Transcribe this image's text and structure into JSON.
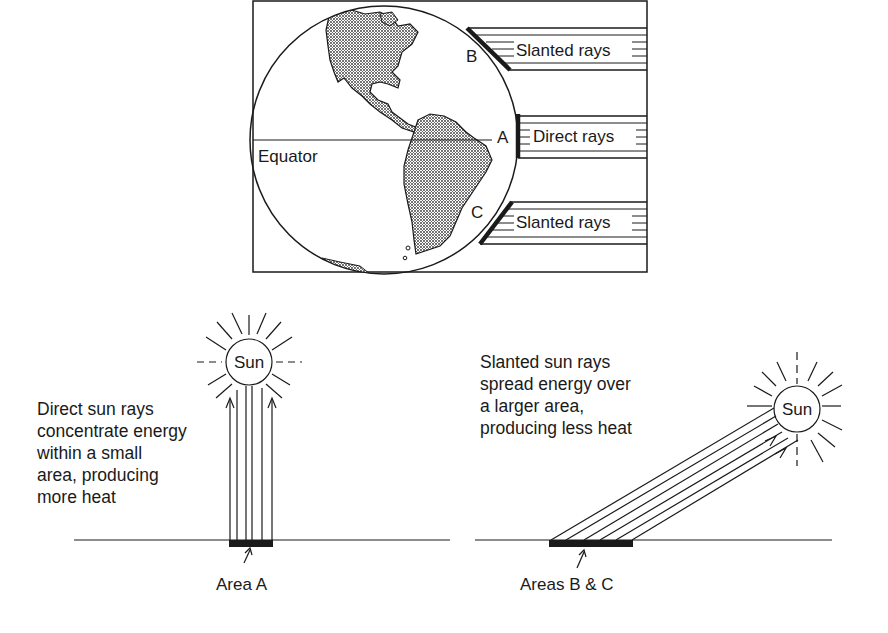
{
  "globe_panel": {
    "equator_label": "Equator",
    "points": [
      {
        "id": "B",
        "label": "B",
        "ray_label": "Slanted rays"
      },
      {
        "id": "A",
        "label": "A",
        "ray_label": "Direct rays"
      },
      {
        "id": "C",
        "label": "C",
        "ray_label": "Slanted rays"
      }
    ]
  },
  "direct_panel": {
    "sun_label": "Sun",
    "description": "Direct sun rays\nconcentrate energy\nwithin a small\narea, producing\nmore heat",
    "area_label": "Area A"
  },
  "slanted_panel": {
    "sun_label": "Sun",
    "description": "Slanted sun rays\nspread energy over\na larger area,\nproducing less heat",
    "area_label": "Areas B & C"
  },
  "colors": {
    "ink": "#1a1a1a",
    "land_fill": "#bdbdbd",
    "background": "#ffffff"
  }
}
